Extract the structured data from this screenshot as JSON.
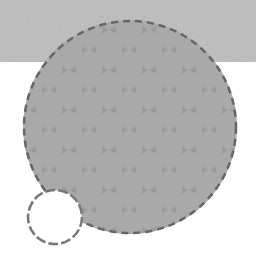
{
  "canvas": {
    "width": 256,
    "height": 261,
    "background": "#ffffff"
  },
  "top_band": {
    "height": 62,
    "color": "#c9c9c9"
  },
  "large_circle": {
    "cx": 130,
    "cy": 127,
    "r": 107,
    "fill": "#a9a9a9",
    "stroke": "#666666",
    "dash": "7 5",
    "pattern": {
      "spacing": 20,
      "blob_color": "#9b9b9b",
      "shape": "bowtie"
    }
  },
  "small_circle": {
    "cx": 55,
    "cy": 217,
    "r": 27,
    "fill": "#ffffff",
    "stroke": "#777777",
    "dash": "10 3"
  }
}
